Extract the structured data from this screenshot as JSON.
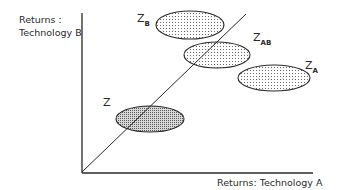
{
  "diagram": {
    "y_axis_label_line1": "Returns :",
    "y_axis_label_line2": "Technology B",
    "x_axis_label": "Returns: Technology A",
    "line": {
      "description": "45-degree diagonal line from origin"
    },
    "regions": [
      {
        "id": "Z",
        "label": "Z",
        "subscript": "",
        "cx": 150,
        "cy": 119,
        "rx": 34,
        "ry": 13,
        "shade": "dense"
      },
      {
        "id": "ZB",
        "label": "Z",
        "subscript": "B",
        "cx": 190,
        "cy": 25,
        "rx": 34,
        "ry": 14,
        "shade": "light"
      },
      {
        "id": "ZAB",
        "label": "Z",
        "subscript": "AB",
        "cx": 217,
        "cy": 55,
        "rx": 33,
        "ry": 13,
        "shade": "light"
      },
      {
        "id": "ZA",
        "label": "Z",
        "subscript": "A",
        "cx": 274,
        "cy": 78,
        "rx": 36,
        "ry": 13,
        "shade": "light"
      }
    ],
    "colors": {
      "ink": "#2a2a2a",
      "fill_light": "#e4e4e4",
      "fill_dense": "#c4c4c4"
    }
  }
}
